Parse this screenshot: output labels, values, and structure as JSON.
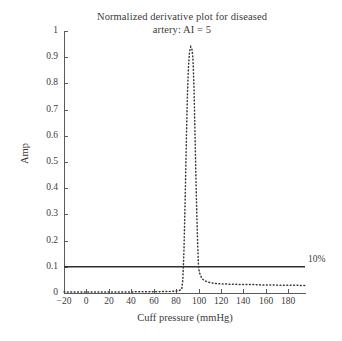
{
  "chart_data": {
    "type": "line",
    "title": "Normalized derivative plot for diseased artery: AI = 5",
    "title_lines": [
      "Normalized derivative plot for diseased",
      "artery: AI = 5"
    ],
    "xlabel": "Cuff pressure (mmHg)",
    "ylabel": "Amp",
    "xlim": [
      -20,
      195
    ],
    "ylim": [
      0,
      1
    ],
    "grid": false,
    "legend": false,
    "xticks": [
      -20,
      0,
      20,
      40,
      60,
      80,
      100,
      120,
      140,
      160,
      180
    ],
    "xtick_labels": [
      "−20",
      "0",
      "20",
      "40",
      "60",
      "80",
      "100",
      "120",
      "140",
      "160",
      "180"
    ],
    "yticks": [
      0,
      0.1,
      0.2,
      0.3,
      0.4,
      0.5,
      0.6,
      0.7,
      0.8,
      0.9,
      1
    ],
    "ytick_labels": [
      "0",
      "0.1",
      "0.2",
      "0.3",
      "0.4",
      "0.5",
      "0.6",
      "0.7",
      "0.8",
      "0.9",
      "1"
    ],
    "annotations": [
      {
        "name": "threshold-10-percent",
        "text": "10%",
        "x": 196,
        "y": 0.1
      }
    ],
    "series": [
      {
        "name": "10% threshold",
        "style": "solid",
        "color": "#2e2e2e",
        "width": 1.6,
        "x": [
          -20,
          195
        ],
        "values": [
          0.1,
          0.1
        ]
      },
      {
        "name": "normalized derivative",
        "style": "dotted",
        "color": "#3a3a3a",
        "width": 1.5,
        "x": [
          -20,
          0,
          20,
          40,
          50,
          60,
          65,
          70,
          74,
          78,
          81,
          83,
          85,
          86,
          87,
          88,
          89,
          90,
          91,
          92,
          93,
          94,
          95,
          96,
          97,
          98,
          99,
          100,
          101,
          103,
          105,
          107,
          110,
          113,
          116,
          120,
          125,
          130,
          135,
          140,
          145,
          150,
          155,
          160,
          165,
          170,
          175,
          180,
          185,
          190,
          195
        ],
        "values": [
          0.004,
          0.004,
          0.004,
          0.004,
          0.005,
          0.005,
          0.005,
          0.006,
          0.006,
          0.007,
          0.008,
          0.01,
          0.014,
          0.05,
          0.16,
          0.34,
          0.55,
          0.74,
          0.86,
          0.92,
          0.94,
          0.935,
          0.9,
          0.78,
          0.58,
          0.38,
          0.22,
          0.1,
          0.075,
          0.056,
          0.048,
          0.044,
          0.04,
          0.038,
          0.036,
          0.035,
          0.034,
          0.033,
          0.033,
          0.032,
          0.032,
          0.032,
          0.031,
          0.031,
          0.031,
          0.03,
          0.03,
          0.03,
          0.03,
          0.029,
          0.029
        ]
      }
    ]
  },
  "colors": {
    "background": "#ffffff",
    "axis": "#5b5b5b",
    "text": "#3b3b3b",
    "solid_line": "#2e2e2e",
    "dotted_line": "#3a3a3a"
  }
}
